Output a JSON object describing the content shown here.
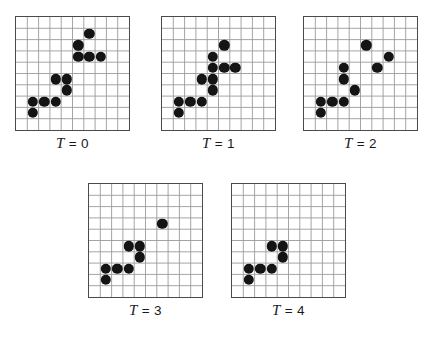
{
  "figure": {
    "title": "",
    "grid": {
      "columns": 10,
      "rows": 10,
      "cell_px": 11.3,
      "line_color": "#9a9a9a",
      "border_color": "#4a4a4a",
      "background_color": "#ffffff"
    },
    "dot": {
      "color": "#141414",
      "diameter_px": 10.4
    },
    "panels": [
      {
        "id": "panel-t0",
        "label_var": "T",
        "label_eq": "= 0",
        "label_value": "0",
        "label_text": "T = 0",
        "x": 15,
        "y": 16,
        "dots": [
          {
            "col": 6,
            "row": 1
          },
          {
            "col": 5,
            "row": 2
          },
          {
            "col": 5,
            "row": 3
          },
          {
            "col": 6,
            "row": 3
          },
          {
            "col": 7,
            "row": 3
          },
          {
            "col": 3,
            "row": 5
          },
          {
            "col": 4,
            "row": 5
          },
          {
            "col": 4,
            "row": 6
          },
          {
            "col": 1,
            "row": 7
          },
          {
            "col": 2,
            "row": 7
          },
          {
            "col": 3,
            "row": 7
          },
          {
            "col": 1,
            "row": 8
          }
        ]
      },
      {
        "id": "panel-t1",
        "label_var": "T",
        "label_eq": "= 1",
        "label_value": "1",
        "label_text": "T = 1",
        "x": 161,
        "y": 16,
        "dots": [
          {
            "col": 5,
            "row": 2
          },
          {
            "col": 4,
            "row": 3
          },
          {
            "col": 4,
            "row": 4
          },
          {
            "col": 5,
            "row": 4
          },
          {
            "col": 6,
            "row": 4
          },
          {
            "col": 3,
            "row": 5
          },
          {
            "col": 4,
            "row": 5
          },
          {
            "col": 4,
            "row": 6
          },
          {
            "col": 1,
            "row": 7
          },
          {
            "col": 2,
            "row": 7
          },
          {
            "col": 3,
            "row": 7
          },
          {
            "col": 1,
            "row": 8
          }
        ]
      },
      {
        "id": "panel-t2",
        "label_var": "T",
        "label_eq": "= 2",
        "label_value": "2",
        "label_text": "T = 2",
        "x": 303,
        "y": 16,
        "dots": [
          {
            "col": 5,
            "row": 2
          },
          {
            "col": 7,
            "row": 3
          },
          {
            "col": 6,
            "row": 4
          },
          {
            "col": 3,
            "row": 4
          },
          {
            "col": 3,
            "row": 5
          },
          {
            "col": 4,
            "row": 6
          },
          {
            "col": 1,
            "row": 7
          },
          {
            "col": 2,
            "row": 7
          },
          {
            "col": 3,
            "row": 7
          },
          {
            "col": 1,
            "row": 8
          }
        ]
      },
      {
        "id": "panel-t3",
        "label_var": "T",
        "label_eq": "= 3",
        "label_value": "3",
        "label_text": "T = 3",
        "x": 88,
        "y": 183,
        "dots": [
          {
            "col": 6,
            "row": 3
          },
          {
            "col": 3,
            "row": 5
          },
          {
            "col": 4,
            "row": 5
          },
          {
            "col": 4,
            "row": 6
          },
          {
            "col": 1,
            "row": 7
          },
          {
            "col": 2,
            "row": 7
          },
          {
            "col": 3,
            "row": 7
          },
          {
            "col": 1,
            "row": 8
          }
        ]
      },
      {
        "id": "panel-t4",
        "label_var": "T",
        "label_eq": "= 4",
        "label_value": "4",
        "label_text": "T = 4",
        "x": 231,
        "y": 183,
        "dots": [
          {
            "col": 3,
            "row": 5
          },
          {
            "col": 4,
            "row": 5
          },
          {
            "col": 4,
            "row": 6
          },
          {
            "col": 1,
            "row": 7
          },
          {
            "col": 2,
            "row": 7
          },
          {
            "col": 3,
            "row": 7
          },
          {
            "col": 1,
            "row": 8
          }
        ]
      }
    ]
  }
}
